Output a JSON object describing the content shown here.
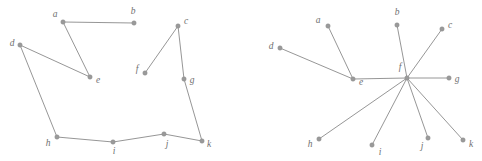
{
  "figure": {
    "title": "",
    "width": 482,
    "height": 161,
    "background_color": "#ffffff",
    "node_color": "#9a9a9a",
    "edge_color": "#8a8a8a",
    "label_color": "#6f6f6f"
  },
  "graphs": [
    {
      "id": "left-graph",
      "name": "path-graph",
      "nodes": [
        {
          "id": "a",
          "label": "a",
          "x": 63,
          "y": 22,
          "lx": 55,
          "ly": 15
        },
        {
          "id": "b",
          "label": "b",
          "x": 134,
          "y": 23,
          "lx": 133,
          "ly": 12
        },
        {
          "id": "c",
          "label": "c",
          "x": 178,
          "y": 26,
          "lx": 186,
          "ly": 22
        },
        {
          "id": "d",
          "label": "d",
          "x": 20,
          "y": 45,
          "lx": 12,
          "ly": 44
        },
        {
          "id": "e",
          "label": "e",
          "x": 90,
          "y": 77,
          "lx": 98,
          "ly": 81
        },
        {
          "id": "f",
          "label": "f",
          "x": 145,
          "y": 73,
          "lx": 137,
          "ly": 70
        },
        {
          "id": "g",
          "label": "g",
          "x": 184,
          "y": 79,
          "lx": 192,
          "ly": 81
        },
        {
          "id": "h",
          "label": "h",
          "x": 57,
          "y": 137,
          "lx": 48,
          "ly": 144
        },
        {
          "id": "i",
          "label": "i",
          "x": 113,
          "y": 142,
          "lx": 114,
          "ly": 152
        },
        {
          "id": "j",
          "label": "j",
          "x": 164,
          "y": 134,
          "lx": 167,
          "ly": 145
        },
        {
          "id": "k",
          "label": "k",
          "x": 202,
          "y": 141,
          "lx": 209,
          "ly": 145
        }
      ],
      "edges": [
        [
          "a",
          "b"
        ],
        [
          "a",
          "e"
        ],
        [
          "d",
          "e"
        ],
        [
          "d",
          "h"
        ],
        [
          "c",
          "f"
        ],
        [
          "c",
          "g"
        ],
        [
          "g",
          "k"
        ],
        [
          "h",
          "i"
        ],
        [
          "i",
          "j"
        ],
        [
          "j",
          "k"
        ]
      ]
    },
    {
      "id": "right-graph",
      "name": "star-graph",
      "nodes": [
        {
          "id": "a",
          "label": "a",
          "x": 328,
          "y": 26,
          "lx": 318,
          "ly": 21
        },
        {
          "id": "b",
          "label": "b",
          "x": 397,
          "y": 25,
          "lx": 397,
          "ly": 13
        },
        {
          "id": "c",
          "label": "c",
          "x": 442,
          "y": 29,
          "lx": 450,
          "ly": 26
        },
        {
          "id": "d",
          "label": "d",
          "x": 280,
          "y": 48,
          "lx": 271,
          "ly": 47
        },
        {
          "id": "e",
          "label": "e",
          "x": 353,
          "y": 79,
          "lx": 361,
          "ly": 83
        },
        {
          "id": "f",
          "label": "f",
          "x": 407,
          "y": 78,
          "lx": 400,
          "ly": 68
        },
        {
          "id": "g",
          "label": "g",
          "x": 449,
          "y": 78,
          "lx": 457,
          "ly": 80
        },
        {
          "id": "h",
          "label": "h",
          "x": 319,
          "y": 139,
          "lx": 310,
          "ly": 145
        },
        {
          "id": "i",
          "label": "i",
          "x": 372,
          "y": 145,
          "lx": 380,
          "ly": 153
        },
        {
          "id": "j",
          "label": "j",
          "x": 428,
          "y": 138,
          "lx": 422,
          "ly": 147
        },
        {
          "id": "k",
          "label": "k",
          "x": 463,
          "y": 140,
          "lx": 471,
          "ly": 145
        }
      ],
      "edges": [
        [
          "d",
          "e"
        ],
        [
          "a",
          "e"
        ],
        [
          "e",
          "f"
        ],
        [
          "f",
          "b"
        ],
        [
          "f",
          "c"
        ],
        [
          "f",
          "g"
        ],
        [
          "f",
          "h"
        ],
        [
          "f",
          "i"
        ],
        [
          "f",
          "j"
        ],
        [
          "f",
          "k"
        ]
      ]
    }
  ]
}
